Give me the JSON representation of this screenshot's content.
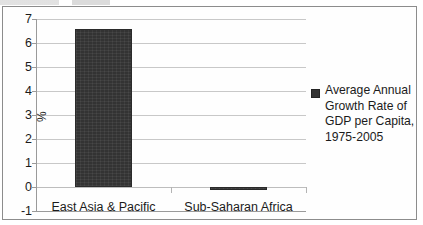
{
  "chart_data": {
    "type": "bar",
    "title": "",
    "xlabel": "",
    "ylabel": "%",
    "categories": [
      "East Asia & Pacific",
      "Sub-Saharan Africa"
    ],
    "values": [
      6.6,
      -0.1
    ],
    "series": [
      {
        "name": "Average Annual Growth Rate of GDP per Capita, 1975-2005",
        "values": [
          6.6,
          -0.1
        ]
      }
    ],
    "ylim": [
      -1,
      7
    ],
    "yticks": [
      "7",
      "6",
      "5",
      "4",
      "3",
      "2",
      "1",
      "0",
      "-1"
    ],
    "grid": true,
    "legend_position": "right",
    "bar_color": "#333333"
  },
  "legend": {
    "marker": "legend-color-swatch",
    "lines": [
      "Average Annual",
      "Growth Rate of",
      "GDP per Capita,",
      "1975-2005"
    ]
  },
  "axis": {
    "y_label": "%"
  }
}
